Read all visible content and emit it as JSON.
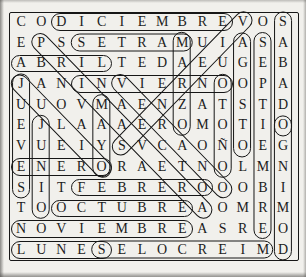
{
  "puzzle": {
    "kind": "word-search",
    "grid_rows": 12,
    "grid_cols": 14,
    "grid": [
      "CODICIEMBREVOS",
      "EPSSETRAMUIASA",
      "ABRILTEDAEUGEB",
      "JANINVIERNOOPA",
      "UUOVMAENZATSTD",
      "EJLAAAEROMOTIO",
      "VUEIYSVCAOÑOEG",
      "ENERORAETNOLMN",
      "SITFEBREROOOBI",
      "TOOCTUBREAOMRM",
      "NOVIEMBREASREO",
      "LUNESELOCREIMD"
    ],
    "circled_words": [
      {
        "word": "DICIEMBRE",
        "from": {
          "row": 1,
          "col": 3
        },
        "to": {
          "row": 1,
          "col": 11
        },
        "direction": "right"
      },
      {
        "word": "MARTES",
        "from": {
          "row": 2,
          "col": 9
        },
        "to": {
          "row": 2,
          "col": 4
        },
        "direction": "left",
        "as_written": "SETRAM"
      },
      {
        "word": "ABRIL",
        "from": {
          "row": 3,
          "col": 1
        },
        "to": {
          "row": 3,
          "col": 5
        },
        "direction": "right"
      },
      {
        "word": "INVIERNO",
        "from": {
          "row": 4,
          "col": 4
        },
        "to": {
          "row": 4,
          "col": 11
        },
        "direction": "right"
      },
      {
        "word": "ENERO",
        "from": {
          "row": 8,
          "col": 1
        },
        "to": {
          "row": 8,
          "col": 5
        },
        "direction": "right"
      },
      {
        "word": "FEBRERO",
        "from": {
          "row": 9,
          "col": 4
        },
        "to": {
          "row": 9,
          "col": 10
        },
        "direction": "right"
      },
      {
        "word": "OCTUBRE",
        "from": {
          "row": 10,
          "col": 3
        },
        "to": {
          "row": 10,
          "col": 9
        },
        "direction": "right"
      },
      {
        "word": "NOVIEMBRE",
        "from": {
          "row": 11,
          "col": 1
        },
        "to": {
          "row": 11,
          "col": 9
        },
        "direction": "right"
      },
      {
        "word": "LUNES",
        "from": {
          "row": 12,
          "col": 1
        },
        "to": {
          "row": 12,
          "col": 5
        },
        "direction": "right"
      },
      {
        "word": "MIERCOLES",
        "from": {
          "row": 12,
          "col": 13
        },
        "to": {
          "row": 12,
          "col": 5
        },
        "direction": "left",
        "as_written": "SELOCREIM"
      },
      {
        "word": "JUEVES",
        "from": {
          "row": 4,
          "col": 1
        },
        "to": {
          "row": 9,
          "col": 1
        },
        "direction": "down"
      },
      {
        "word": "JUNIO",
        "from": {
          "row": 6,
          "col": 2
        },
        "to": {
          "row": 10,
          "col": 2
        },
        "direction": "down"
      },
      {
        "word": "MAYO",
        "from": {
          "row": 5,
          "col": 5
        },
        "to": {
          "row": 8,
          "col": 5
        },
        "direction": "down"
      },
      {
        "word": "MARZO",
        "from": {
          "row": 2,
          "col": 9
        },
        "to": {
          "row": 6,
          "col": 9
        },
        "direction": "down"
      },
      {
        "word": "OTOÑO",
        "from": {
          "row": 4,
          "col": 11
        },
        "to": {
          "row": 8,
          "col": 11
        },
        "direction": "down"
      },
      {
        "word": "AGOSTO",
        "from": {
          "row": 2,
          "col": 12
        },
        "to": {
          "row": 7,
          "col": 12
        },
        "direction": "down"
      },
      {
        "word": "SEPTIEMBRE",
        "from": {
          "row": 2,
          "col": 13
        },
        "to": {
          "row": 11,
          "col": 13
        },
        "direction": "down"
      },
      {
        "word": "SABADO",
        "from": {
          "row": 1,
          "col": 14
        },
        "to": {
          "row": 6,
          "col": 14
        },
        "direction": "down"
      },
      {
        "word": "DOMINGO",
        "from": {
          "row": 12,
          "col": 14
        },
        "to": {
          "row": 6,
          "col": 14
        },
        "direction": "up",
        "as_written": "OGNIMOD"
      },
      {
        "word": "PRIMAVERA",
        "from": {
          "row": 2,
          "col": 2
        },
        "to": {
          "row": 10,
          "col": 10
        },
        "direction": "down-right"
      },
      {
        "word": "JULIO",
        "from": {
          "row": 4,
          "col": 1
        },
        "to": {
          "row": 8,
          "col": 5
        },
        "direction": "down-right"
      },
      {
        "word": "VERANO",
        "from": {
          "row": 4,
          "col": 6
        },
        "to": {
          "row": 9,
          "col": 11
        },
        "direction": "down-right"
      },
      {
        "word": "VIERNES",
        "from": {
          "row": 1,
          "col": 12
        },
        "to": {
          "row": 7,
          "col": 6
        },
        "direction": "down-left"
      }
    ],
    "colors": {
      "ink": "#1c1c1c",
      "circle_line": "#161616",
      "paper": "#f1f0ec",
      "scan_edge": "#464542"
    }
  }
}
